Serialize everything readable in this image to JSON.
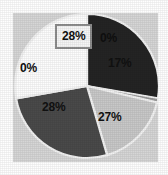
{
  "chart_data": {
    "type": "pie",
    "title": "",
    "subtitle": "",
    "xlabel": "",
    "ylabel": "",
    "legend": "none",
    "grid": false,
    "labels_format": "percent",
    "categories": [
      "Segment 1",
      "Segment 2",
      "Segment 3",
      "Segment 4",
      "Segment 5"
    ],
    "values": [
      28,
      0,
      17,
      27,
      28
    ],
    "data_labels": [
      "28%",
      "0%",
      "17%",
      "27%",
      "28%"
    ],
    "colors": [
      "#242424",
      "#9a9a9a",
      "#c8c8c8",
      "#4a4a4a",
      "#fdfdfd"
    ],
    "start_angle_deg": 0,
    "direction": "clockwise",
    "slices": [
      {
        "label": "28%",
        "value": 28,
        "color": "#242424",
        "position": "top-left",
        "label_boxed": true
      },
      {
        "label": "0%",
        "value": 0,
        "color": "#9a9a9a",
        "position": "top-right-edge",
        "label_boxed": false
      },
      {
        "label": "17%",
        "value": 17,
        "color": "#c8c8c8",
        "position": "right",
        "label_boxed": false
      },
      {
        "label": "27%",
        "value": 27,
        "color": "#4a4a4a",
        "position": "bottom-right",
        "label_boxed": false
      },
      {
        "label": "28%",
        "value": 28,
        "color": "#fdfdfd",
        "position": "bottom-left",
        "label_boxed": false
      },
      {
        "label": "0%",
        "value": 0,
        "color": "#fdfdfd",
        "position": "left-edge",
        "label_boxed": false
      }
    ]
  },
  "chart": {
    "panel_color": "#d6d6d6",
    "background_color": "#fefefe",
    "slice_border_color": "#f2f2f2",
    "label_box_border_color": "#8d8d8d",
    "label_box_fill_color": "#f6f6f6",
    "label_text_color": "#111111"
  },
  "labels": {
    "top_boxed": "28%",
    "zero_top_right": "0%",
    "seventeen": "17%",
    "twenty_seven": "27%",
    "twenty_eight_bottom": "28%",
    "zero_left": "0%"
  }
}
